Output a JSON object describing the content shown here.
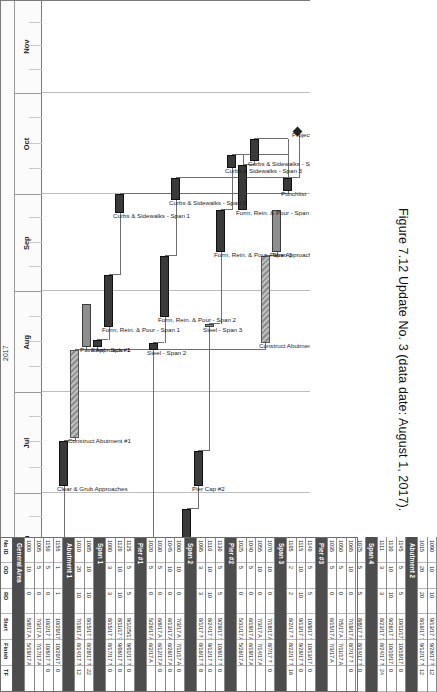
{
  "figure": {
    "caption": "Figure 7.12  Update No. 3 (data date: August 1, 2017).",
    "data_date": "August 1, 2017",
    "update_no": "Update No. 3"
  },
  "timeline": {
    "year": "2017",
    "months": [
      "May",
      "Jun",
      "Jul",
      "Aug",
      "Sep",
      "Oct",
      "Nov"
    ]
  },
  "table": {
    "headers": [
      "No ID",
      "OD",
      "RD",
      "Start",
      "Finish",
      "TF"
    ],
    "groups": [
      {
        "name": "General Area",
        "rows": [
          {
            "id": "1000",
            "od": "10",
            "rd": "0",
            "start": "5/8/17 A",
            "finish": "5/19/17 A",
            "tf": ""
          },
          {
            "id": "1005",
            "od": "5",
            "rd": "0",
            "start": "7/3/17 A",
            "finish": "7/17/17 A",
            "tf": ""
          },
          {
            "id": "1150",
            "od": "5",
            "rd": "0",
            "start": "10/2/17 ?",
            "finish": "10/6/17 ?",
            "tf": "0"
          },
          {
            "id": "1155",
            "od": "1",
            "rd": "1",
            "start": "10/20/17 ?",
            "finish": "10/20/17 ?",
            "tf": "0"
          }
        ]
      },
      {
        "name": "Abutment 1",
        "rows": [
          {
            "id": "1010",
            "od": "20",
            "rd": "10",
            "start": "7/18/17 A",
            "finish": "8/14/17 ?",
            "tf": "12"
          },
          {
            "id": "1085",
            "od": "10",
            "rd": "10",
            "start": "8/15/17 ?",
            "finish": "8/28/17 ?",
            "tf": "22"
          }
        ]
      },
      {
        "name": "Span 1",
        "rows": [
          {
            "id": "1080",
            "od": "3",
            "rd": "3",
            "start": "8/15/17 ?",
            "finish": "8/17/17 ?",
            "tf": "0"
          },
          {
            "id": "1120",
            "od": "10",
            "rd": "10",
            "start": "8/11/17 ?",
            "finish": "9/06/17 ?",
            "tf": "0"
          },
          {
            "id": "1125",
            "od": "5",
            "rd": "5",
            "start": "9/1/25/17",
            "finish": "9/01/17 ?",
            "tf": "0"
          }
        ]
      },
      {
        "name": "Pier #1",
        "rows": [
          {
            "id": "1020",
            "od": "5",
            "rd": "0",
            "start": "5/26/17 A",
            "finish": "6/2/17 A",
            "tf": ""
          },
          {
            "id": "1030",
            "od": "5",
            "rd": "0",
            "start": "6/6/17 A",
            "finish": "6/12/17 A",
            "tf": "0"
          },
          {
            "id": "1045",
            "od": "10",
            "rd": "0",
            "start": "6/13/17 A",
            "finish": "6/26/17 A",
            "tf": "0"
          },
          {
            "id": "1060",
            "od": "10",
            "rd": "0",
            "start": "7/3/17 A",
            "finish": "7/11/17 A",
            "tf": "0"
          }
        ]
      },
      {
        "name": "Span 2",
        "rows": [
          {
            "id": "1095",
            "od": "3",
            "rd": "3",
            "start": "8/1/17 ?",
            "finish": "8/16/17 ?",
            "tf": "8"
          },
          {
            "id": "1110",
            "od": "10",
            "rd": "10",
            "start": "8/24/17 ?",
            "finish": "9/12/17 ?",
            "tf": "0"
          },
          {
            "id": "1130",
            "od": "5",
            "rd": "5",
            "start": "9/29/17 ?",
            "finish": "10/6/17 ?",
            "tf": "0"
          }
        ]
      },
      {
        "name": "Pier #2",
        "rows": [
          {
            "id": "1025",
            "od": "5",
            "rd": "0",
            "start": "5/31/17 A",
            "finish": "5/26/17 A",
            "tf": ""
          },
          {
            "id": "1040",
            "od": "5",
            "rd": "0",
            "start": "6/19/17 A",
            "finish": "6/19/17 A",
            "tf": ""
          },
          {
            "id": "1055",
            "od": "10",
            "rd": "0",
            "start": "7/3/17 A",
            "finish": "7/14/17 A",
            "tf": ""
          },
          {
            "id": "1070",
            "od": "10",
            "rd": "0",
            "start": "7/18/17 A",
            "finish": "8/7/17 ?",
            "tf": "0"
          }
        ]
      },
      {
        "name": "Span 3",
        "rows": [
          {
            "id": "1105",
            "od": "2",
            "rd": "2",
            "start": "8/2/17 ?",
            "finish": "8/22/17 ?",
            "tf": "16"
          },
          {
            "id": "1115",
            "od": "10",
            "rd": "10",
            "start": "9/13/17 ?",
            "finish": "9/26/17 ?",
            "tf": "0"
          },
          {
            "id": "1140",
            "od": "5",
            "rd": "5",
            "start": "10/9/17 ?",
            "finish": "10/13/17 ?",
            "tf": "0"
          }
        ]
      },
      {
        "name": "Pier #3",
        "rows": [
          {
            "id": "1035",
            "od": "5",
            "rd": "0",
            "start": "6/15/17 A",
            "finish": "7/3/17 A",
            "tf": ""
          },
          {
            "id": "1050",
            "od": "5",
            "rd": "0",
            "start": "7/5/17 A",
            "finish": "7/11/17 A",
            "tf": ""
          },
          {
            "id": "1065",
            "od": "10",
            "rd": "0",
            "start": "7/19/17 A",
            "finish": "8/7/17 ?",
            "tf": "0"
          },
          {
            "id": "1075",
            "od": "5",
            "rd": "5",
            "start": "8/8/17 ?",
            "finish": "8/14/17 ?",
            "tf": "0"
          }
        ]
      },
      {
        "name": "Span 4",
        "rows": [
          {
            "id": "1111",
            "od": "3",
            "rd": "3",
            "start": "8/23/17 ?",
            "finish": "8/24/17 ?",
            "tf": "24"
          },
          {
            "id": "1130",
            "od": "10",
            "rd": "10",
            "start": "9/26/17 ?",
            "finish": "10/10/17 ?",
            "tf": "0"
          },
          {
            "id": "1145",
            "od": "5",
            "rd": "5",
            "start": "10/11/17 ?",
            "finish": "10/18/17 ?",
            "tf": "0"
          }
        ]
      },
      {
        "name": "Abutment 2",
        "rows": [
          {
            "id": "1015",
            "od": "20",
            "rd": "20",
            "start": "8/16/17 ?",
            "finish": "9/12/17 ?",
            "tf": "12"
          },
          {
            "id": "1090",
            "od": "10",
            "rd": "10",
            "start": "9/13/17 ?",
            "finish": "9/26/17 ?",
            "tf": "12"
          }
        ]
      }
    ]
  },
  "chart_data": {
    "type": "bar",
    "xlabel": "2017",
    "ylabel": "Activities",
    "axis_start": "2017-05-01",
    "axis_end": "2017-11-30",
    "grid": true,
    "legend_position": "none",
    "bar_styles": {
      "critical": "#3a3a3a",
      "complete": "#9a9a9a-hatched",
      "normal": "#8e8e8e"
    },
    "tasks": [
      {
        "label": "Mobilization",
        "start": "2017-05-08",
        "finish": "2017-05-19",
        "style": "crit",
        "lane": 0
      },
      {
        "label": "Clear & Grub Approaches",
        "start": "2017-07-03",
        "finish": "2017-07-17",
        "style": "crit",
        "lane": 1
      },
      {
        "label": "Construct Abutment #1",
        "start": "2017-07-18",
        "finish": "2017-08-14",
        "style": "done",
        "lane": 2
      },
      {
        "label": "Pave Approach #1",
        "start": "2017-08-15",
        "finish": "2017-08-28",
        "style": "norm",
        "lane": 3
      },
      {
        "label": "Steel - Span 1",
        "start": "2017-08-15",
        "finish": "2017-08-17",
        "style": "crit",
        "lane": 4
      },
      {
        "label": "Form, Rein. & Pour - Span 1",
        "start": "2017-08-21",
        "finish": "2017-09-06",
        "style": "crit",
        "lane": 5
      },
      {
        "label": "Curbs & Sidewalks - Span 1",
        "start": "2017-09-25",
        "finish": "2017-10-01",
        "style": "crit",
        "lane": 6
      },
      {
        "label": "Form, Rein. & Pour - Column #1",
        "start": "2017-05-26",
        "finish": "2017-06-02",
        "style": "crit",
        "lane": 7
      },
      {
        "label": "Pier Cap #1",
        "start": "2017-06-06",
        "finish": "2017-06-12",
        "style": "crit",
        "lane": 8
      },
      {
        "label": "Steel - Span 2",
        "start": "2017-08-14",
        "finish": "2017-08-16",
        "style": "crit",
        "lane": 9
      },
      {
        "label": "Form, Rein. & Pour - Span 2",
        "start": "2017-08-24",
        "finish": "2017-09-12",
        "style": "crit",
        "lane": 10
      },
      {
        "label": "Curbs & Sidewalks - Span 2",
        "start": "2017-09-29",
        "finish": "2017-10-06",
        "style": "crit",
        "lane": 11
      },
      {
        "label": "Form, Rein. & Pour - Column #2",
        "start": "2017-05-31",
        "finish": "2017-06-26",
        "style": "crit",
        "lane": 12
      },
      {
        "label": "Pier Cap #2",
        "start": "2017-07-03",
        "finish": "2017-07-14",
        "style": "crit",
        "lane": 13
      },
      {
        "label": "Steel - Span 3",
        "start": "2017-08-21",
        "finish": "2017-08-22",
        "style": "norm",
        "lane": 14
      },
      {
        "label": "Form, Rein. & Pour - Span 3",
        "start": "2017-09-13",
        "finish": "2017-09-26",
        "style": "crit",
        "lane": 15
      },
      {
        "label": "Curbs & Sidewalks - Span 3",
        "start": "2017-10-09",
        "finish": "2017-10-13",
        "style": "crit",
        "lane": 16
      },
      {
        "label": "Form, Rein. & Pour - Span 4",
        "start": "2017-09-26",
        "finish": "2017-10-10",
        "style": "crit",
        "lane": 17
      },
      {
        "label": "Curbs & Sidewalks - Span 4",
        "start": "2017-10-11",
        "finish": "2017-10-18",
        "style": "crit",
        "lane": 18
      },
      {
        "label": "Construct Abutment #2",
        "start": "2017-08-16",
        "finish": "2017-09-12",
        "style": "done",
        "lane": 19
      },
      {
        "label": "Pave Approach #1",
        "start": "2017-09-13",
        "finish": "2017-09-26",
        "style": "norm",
        "lane": 20
      },
      {
        "label": "Punchlist",
        "start": "2017-10-02",
        "finish": "2017-10-06",
        "style": "crit",
        "lane": 21
      },
      {
        "label": "Project Complete",
        "start": "2017-10-20",
        "finish": "2017-10-20",
        "style": "crit",
        "lane": 22
      }
    ]
  }
}
